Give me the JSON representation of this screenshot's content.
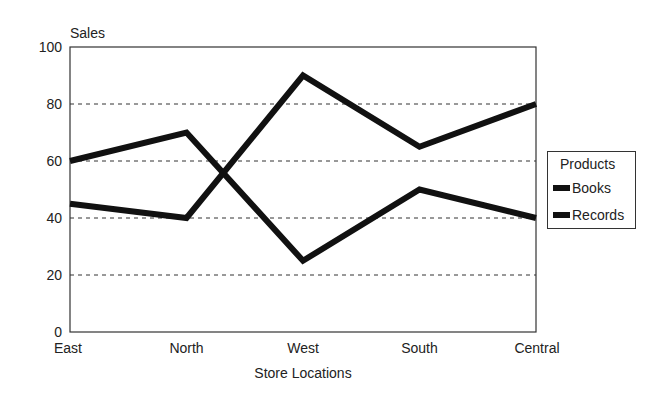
{
  "chart_data": {
    "type": "line",
    "title": "",
    "xlabel": "Store Locations",
    "ylabel": "Sales",
    "categories": [
      "East",
      "North",
      "West",
      "South",
      "Central"
    ],
    "series": [
      {
        "name": "Books",
        "values": [
          60,
          70,
          25,
          50,
          40
        ]
      },
      {
        "name": "Records",
        "values": [
          45,
          40,
          90,
          65,
          80
        ]
      }
    ],
    "ylim": [
      0,
      100
    ],
    "yticks": [
      0,
      20,
      40,
      60,
      80,
      100
    ],
    "grid": "horizontal dashed",
    "legend": {
      "title": "Products",
      "position": "right"
    },
    "line_color": "#111111"
  },
  "axis": {
    "ylabel": "Sales",
    "xlabel": "Store Locations",
    "yticks": [
      "0",
      "20",
      "40",
      "60",
      "80",
      "100"
    ],
    "xticks": [
      "East",
      "North",
      "West",
      "South",
      "Central"
    ]
  },
  "legend": {
    "title": "Products",
    "items": [
      "Books",
      "Records"
    ]
  }
}
